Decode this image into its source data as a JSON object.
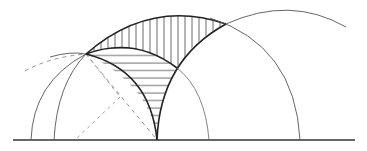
{
  "diagram": {
    "type": "geometric-construction",
    "colors": {
      "background": "#ffffff",
      "stroke": "#222222",
      "thin_stroke": "#555555",
      "dashed": "#888888"
    },
    "baseline": {
      "x1": 13,
      "x2": 355,
      "y": 140
    },
    "points": {
      "cusp": [
        157,
        140
      ],
      "left_intersection": [
        86,
        54
      ],
      "right_intersection": [
        226,
        24
      ]
    },
    "regions": [
      {
        "name": "upper-lune",
        "hatch": "vertical"
      },
      {
        "name": "lower-lune",
        "hatch": "horizontal"
      }
    ]
  }
}
